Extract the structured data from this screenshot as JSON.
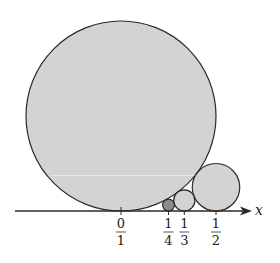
{
  "figure": {
    "axis_label": "x",
    "colors": {
      "circle_fill": "#d3d3d3",
      "highlight_fill": "#8c8c8c",
      "stroke": "#2a2a2a",
      "axis": "#2a2a2a"
    },
    "circles": [
      {
        "p": 0,
        "q": 1,
        "x": 0.0,
        "radius_units": 0.5,
        "highlighted": false
      },
      {
        "p": 1,
        "q": 4,
        "x": 0.25,
        "radius_units": 0.03125,
        "highlighted": true
      },
      {
        "p": 1,
        "q": 3,
        "x": 0.3333,
        "radius_units": 0.05556,
        "highlighted": false
      },
      {
        "p": 1,
        "q": 2,
        "x": 0.5,
        "radius_units": 0.125,
        "highlighted": false
      }
    ],
    "ticks": [
      {
        "num": "0",
        "den": "1"
      },
      {
        "num": "1",
        "den": "4"
      },
      {
        "num": "1",
        "den": "3"
      },
      {
        "num": "1",
        "den": "2"
      }
    ]
  }
}
